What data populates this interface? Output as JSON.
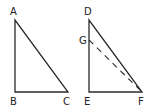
{
  "diagram": {
    "stroke_color": "#2a2a2a",
    "triangles": [
      {
        "name": "ABC",
        "vertices": {
          "A": {
            "label": "A",
            "x": 15,
            "y": 20
          },
          "B": {
            "label": "B",
            "x": 15,
            "y": 92
          },
          "C": {
            "label": "C",
            "x": 68,
            "y": 92
          }
        }
      },
      {
        "name": "DEF",
        "vertices": {
          "D": {
            "label": "D",
            "x": 89,
            "y": 20
          },
          "E": {
            "label": "E",
            "x": 89,
            "y": 92
          },
          "F": {
            "label": "F",
            "x": 142,
            "y": 92
          }
        },
        "extra_points": {
          "G": {
            "label": "G",
            "x": 89,
            "y": 40
          }
        },
        "dashed_segment": [
          "G",
          "F"
        ]
      }
    ]
  }
}
